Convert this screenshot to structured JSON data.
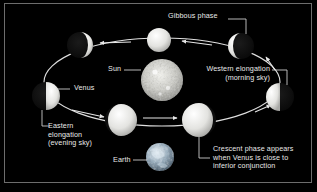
{
  "figure": {
    "background_color": "#000000",
    "frame_color": "#6d6d6d",
    "text_color": "#e9e9e9",
    "orbit_color": "#f2f2f2"
  },
  "labels": {
    "gibbous_phase": "Gibbous phase",
    "sun": "Sun",
    "western_elongation_line1": "Western elongation",
    "western_elongation_line2": "(morning sky)",
    "venus": "Venus",
    "eastern_elongation_line1": "Eastern",
    "eastern_elongation_line2": "elongation",
    "eastern_elongation_line3": "(evening sky)",
    "earth": "Earth",
    "crescent_line1": "Crescent phase appears",
    "crescent_line2": "when Venus is close to",
    "crescent_line3": "inferior conjunction"
  },
  "bodies": {
    "sun": {
      "name": "Sun",
      "cx": 162,
      "cy": 80,
      "r": 21,
      "kind": "textured-sun"
    },
    "earth": {
      "name": "Earth",
      "cx": 160,
      "cy": 157,
      "r": 14,
      "kind": "textured-earth"
    },
    "venus_phases": [
      {
        "id": "upper-left-gibbous",
        "cx": 80,
        "cy": 45,
        "r": 13,
        "lit": "right",
        "fraction": 0.82
      },
      {
        "id": "top-full",
        "cx": 159,
        "cy": 40,
        "r": 12,
        "lit": "full",
        "fraction": 1.0
      },
      {
        "id": "upper-right-gibbous",
        "cx": 241,
        "cy": 46,
        "r": 13,
        "lit": "left",
        "fraction": 0.82
      },
      {
        "id": "right-half",
        "cx": 280,
        "cy": 97,
        "r": 14,
        "lit": "left",
        "fraction": 0.5
      },
      {
        "id": "left-half",
        "cx": 46,
        "cy": 96,
        "r": 14,
        "lit": "right",
        "fraction": 0.5
      },
      {
        "id": "bottom-left-crescent",
        "cx": 121,
        "cy": 120,
        "r": 16,
        "lit": "right",
        "fraction": 0.22
      },
      {
        "id": "bottom-right-crescent",
        "cx": 199,
        "cy": 120,
        "r": 17,
        "lit": "left",
        "fraction": 0.22
      }
    ]
  },
  "icons": {
    "orbit_arrow": "arrow-icon",
    "leader_line": "leader-line-icon"
  }
}
